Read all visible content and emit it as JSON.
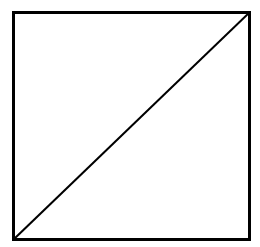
{
  "figure": {
    "name": "square-with-diagonal",
    "canvas": {
      "width": 260,
      "height": 247,
      "background_color": "#ffffff"
    },
    "stroke_color": "#000000",
    "fill_color": "#ffffff",
    "square": {
      "label": "square-outline",
      "left": 13.5,
      "top": 12.5,
      "right": 249.5,
      "bottom": 239.5,
      "width": 236,
      "height": 227,
      "stroke_width": 3
    },
    "diagonal": {
      "label": "diagonal-line",
      "x1": 13.5,
      "y1": 239.5,
      "x2": 249.5,
      "y2": 12.5,
      "stroke_width": 2,
      "direction": "bottom-left-to-top-right"
    },
    "regions": [
      {
        "label": "upper-left-triangle"
      },
      {
        "label": "lower-right-triangle"
      }
    ]
  }
}
